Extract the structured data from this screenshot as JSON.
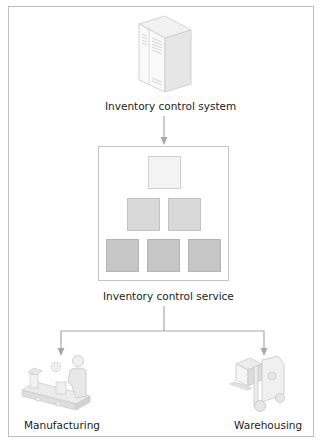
{
  "diagram": {
    "nodes": {
      "system": {
        "label": "Inventory control system",
        "icon": "server-cabinet-icon"
      },
      "service": {
        "label": "Inventory control service",
        "hierarchy_rows": [
          1,
          2,
          3
        ],
        "row_colors": [
          "#f3f3f3",
          "#d9d9d9",
          "#c6c6c6"
        ]
      },
      "manufacturing": {
        "label": "Manufacturing",
        "icon": "assembly-line-worker-icon"
      },
      "warehousing": {
        "label": "Warehousing",
        "icon": "forklift-icon"
      }
    },
    "edges": [
      {
        "from": "Inventory control system",
        "to": "Inventory control service"
      },
      {
        "from": "Inventory control service",
        "to": "Manufacturing"
      },
      {
        "from": "Inventory control service",
        "to": "Warehousing"
      }
    ],
    "colors": {
      "frame": "#bdbdbd",
      "connector": "#a8a8a8",
      "text": "#222222"
    }
  }
}
